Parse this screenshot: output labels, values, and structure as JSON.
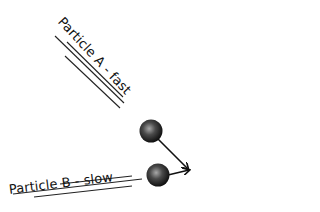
{
  "diagram": {
    "particle_a": {
      "label": "Particle A - fast",
      "speed": "fast"
    },
    "particle_b": {
      "label": "Particle B - slow",
      "speed": "slow"
    },
    "colors": {
      "particle_dark": "#1a1a1a",
      "particle_highlight": "#9a9a9a",
      "line": "#222222",
      "background": "#ffffff"
    }
  }
}
